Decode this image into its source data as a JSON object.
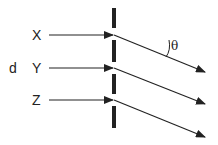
{
  "diagram": {
    "labels": {
      "x": "X",
      "y": "Y",
      "z": "Z",
      "d": "d",
      "theta": "θ"
    },
    "colors": {
      "ink": "#222222",
      "background": "#ffffff"
    }
  }
}
